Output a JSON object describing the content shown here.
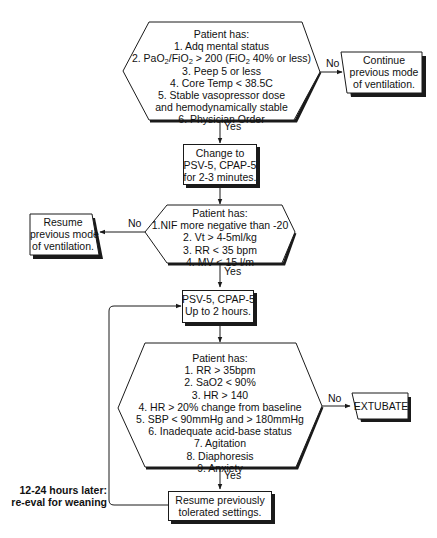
{
  "flowchart": {
    "decision1": {
      "title": "Patient has:",
      "items": [
        "1. Adq mental status",
        "2. PaO2/FiO2 > 200 (FiO2 40% or less)",
        "3. Peep 5 or less",
        "4. Core Temp < 38.5C",
        "5. Stable vasopressor dose",
        "and hemodynamically stable",
        "6. Physician Order"
      ],
      "no_label": "No",
      "yes_label": "Yes"
    },
    "continue_box": {
      "lines": [
        "Continue",
        "previous mode",
        "of ventilation."
      ]
    },
    "change_box": {
      "lines": [
        "Change to",
        "PSV-5, CPAP-5",
        "for 2-3 minutes."
      ]
    },
    "decision2": {
      "title": "Patient has:",
      "items": [
        "1.NIF more negative than -20",
        "2. Vt > 4-5ml/kg",
        "3. RR < 35 bpm",
        "4. MV < 15 l/m"
      ],
      "no_label": "No",
      "yes_label": "Yes"
    },
    "resume_prev_box": {
      "lines": [
        "Resume",
        "previous mode",
        "of ventilation."
      ]
    },
    "psv_box": {
      "lines": [
        "PSV-5, CPAP-5",
        "Up to 2 hours."
      ]
    },
    "decision3": {
      "title": "Patient has:",
      "items": [
        "1. RR > 35bpm",
        "2. SaO2 < 90%",
        "3. HR > 140",
        "4. HR > 20% change from baseline",
        "5. SBP < 90mmHg and > 180mmHg",
        "6. Inadequate acid-base status",
        "7. Agitation",
        "8. Diaphoresis",
        "9. Anxiety"
      ],
      "no_label": "No",
      "yes_label": "Yes"
    },
    "extubate_box": {
      "label": "EXTUBATE"
    },
    "resume_tolerated_box": {
      "lines": [
        "Resume previously",
        "tolerated settings."
      ]
    },
    "loop_note": {
      "lines": [
        "12-24 hours later:",
        "re-eval for weaning"
      ]
    }
  },
  "colors": {
    "stroke": "#1a1a1a",
    "background": "#ffffff"
  }
}
